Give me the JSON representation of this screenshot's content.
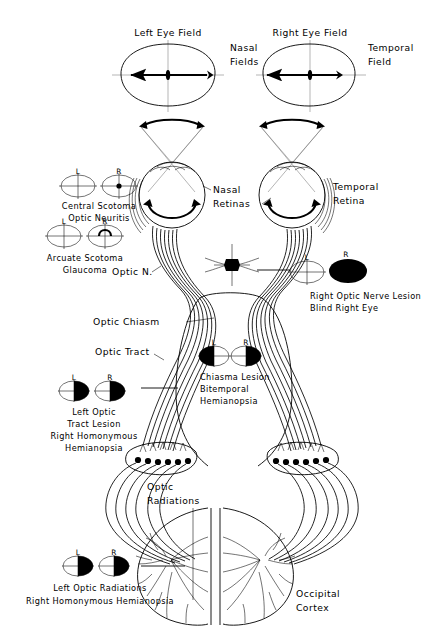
{
  "figure": {
    "type": "anatomical-diagram",
    "background_color": "#ffffff",
    "ink_color": "#000000"
  },
  "top_fields": {
    "left": {
      "heading": "Left  Eye  Field",
      "side_label_line1": "Nasal",
      "side_label_line2": "Fields"
    },
    "right": {
      "heading": "Right  Eye  Field",
      "side_label_line1": "Temporal",
      "side_label_line2": "Field"
    }
  },
  "retina_labels": {
    "nasal_line1": "Nasal",
    "nasal_line2": "Retinas",
    "temporal_line1": "Temporal",
    "temporal_line2": "Retina"
  },
  "pathway_labels": {
    "optic_nerve": "Optic N.",
    "optic_chiasm": "Optic  Chiasm",
    "optic_tract": "Optic  Tract",
    "optic_radiations_line1": "Optic",
    "optic_radiations_line2": "Radiations",
    "occipital_line1": "Occipital",
    "occipital_line2": "Cortex"
  },
  "eye_marks": {
    "left": "L",
    "right": "R"
  },
  "lesions": [
    {
      "id": "central-scotoma",
      "lines": [
        "Central  Scotoma",
        "Optic  Neuritis"
      ],
      "left_mark": "L",
      "right_mark": "R",
      "pattern_left": "normal",
      "pattern_right": "central-dot"
    },
    {
      "id": "arcuate-scotoma",
      "lines": [
        "Arcuate  Scotoma",
        "Glaucoma"
      ],
      "left_mark": "L",
      "right_mark": "R",
      "pattern_left": "normal",
      "pattern_right": "arcuate-arc"
    },
    {
      "id": "right-optic-nerve-lesion",
      "lines": [
        "Right Optic Nerve Lesion",
        "Blind Right Eye"
      ],
      "left_mark": "L",
      "right_mark": "R",
      "pattern_left": "normal",
      "pattern_right": "full-black"
    },
    {
      "id": "chiasma-lesion",
      "lines": [
        "Chiasma  Lesion",
        "Bitemporal",
        "Hemianopsia"
      ],
      "left_mark": "L",
      "right_mark": "R",
      "pattern_left": "left-half-black",
      "pattern_right": "right-half-black"
    },
    {
      "id": "left-optic-tract-lesion",
      "lines": [
        "Left  Optic",
        "Tract  Lesion",
        "Right Homonymous",
        "Hemianopsia"
      ],
      "left_mark": "L",
      "right_mark": "R",
      "pattern_left": "right-half-black",
      "pattern_right": "right-half-black"
    },
    {
      "id": "left-optic-radiations-lesion",
      "lines": [
        "Left Optic Radiations",
        "Right Homonymous  Hemianopsia"
      ],
      "left_mark": "L",
      "right_mark": "R",
      "pattern_left": "right-half-black",
      "pattern_right": "right-half-black"
    }
  ]
}
